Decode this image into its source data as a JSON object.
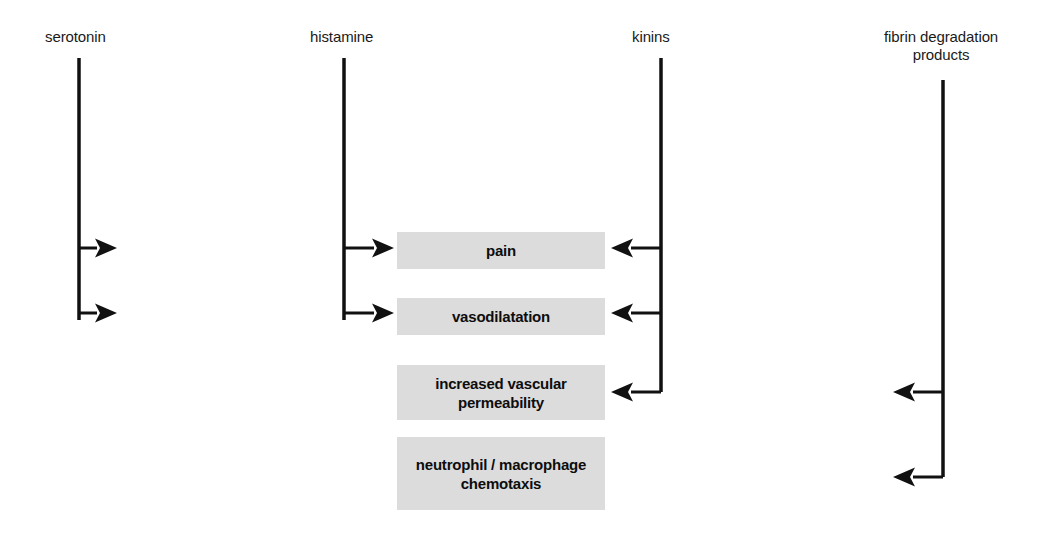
{
  "diagram": {
    "background_color": "#ffffff",
    "line_color": "#111111",
    "box_fill_color": "#dcdcdc",
    "box_text_color": "#0d0d0d",
    "label_text_color": "#1a1a1a",
    "sources": [
      {
        "id": "serotonin",
        "label": "serotonin",
        "label_x": 45,
        "label_y": 28,
        "line_x": 79,
        "line_top": 58,
        "line_bottom": 320,
        "arrow_direction": "right",
        "arrow_rows": [
          248,
          313
        ],
        "arrow_length": 38
      },
      {
        "id": "histamine",
        "label": "histamine",
        "label_x": 310,
        "label_y": 28,
        "line_x": 344,
        "line_top": 58,
        "line_bottom": 320,
        "arrow_direction": "right",
        "arrow_rows": [
          248,
          313
        ],
        "arrow_length": 50
      },
      {
        "id": "kinins",
        "label": "kinins",
        "label_x": 632,
        "label_y": 28,
        "line_x": 661,
        "line_top": 58,
        "line_bottom": 392,
        "arrow_direction": "left",
        "arrow_rows": [
          248,
          313,
          392
        ],
        "arrow_length": 50
      },
      {
        "id": "fibrin-degradation-products",
        "label": "fibrin degradation\nproducts",
        "label_x": 884,
        "label_y": 28,
        "line_x": 943,
        "line_top": 80,
        "line_bottom": 477,
        "arrow_direction": "left",
        "arrow_rows": [
          392,
          477
        ],
        "arrow_length": 50
      }
    ],
    "effects": [
      {
        "id": "pain",
        "label": "pain",
        "x": 397,
        "y": 232,
        "width": 208,
        "height": 37
      },
      {
        "id": "vasodilatation",
        "label": "vasodilatation",
        "x": 397,
        "y": 298,
        "width": 208,
        "height": 37
      },
      {
        "id": "increased-vascular-permeability",
        "label": "increased vascular\npermeability",
        "x": 397,
        "y": 365,
        "width": 208,
        "height": 55
      },
      {
        "id": "neutrophil-macrophage-chemotaxis",
        "label": "neutrophil / macrophage\nchemotaxis",
        "x": 397,
        "y": 437,
        "width": 208,
        "height": 73
      }
    ]
  }
}
